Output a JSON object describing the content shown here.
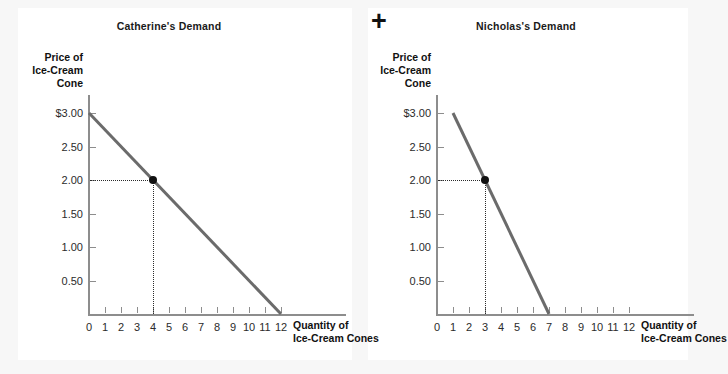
{
  "figure": {
    "operator": "+",
    "background_color": "#f7f7f7",
    "panel_color": "#ffffff",
    "curve_color": "#6b6b6b",
    "axis_color": "#8d8d8d",
    "point_color": "#111111"
  },
  "chart_data": [
    {
      "type": "line",
      "title": "Catherine's Demand",
      "xlabel": "Quantity of Ice-Cream Cones",
      "ylabel": "Price of Ice-Cream Cone",
      "xlabel_lines": [
        "Quantity of",
        "Ice-Cream Cones"
      ],
      "ylabel_lines": [
        "Price of",
        "Ice-Cream",
        "Cone"
      ],
      "xlim": [
        0,
        12
      ],
      "ylim": [
        0,
        3.0
      ],
      "grid": false,
      "legend": "none",
      "xticks": [
        0,
        1,
        2,
        3,
        4,
        5,
        6,
        7,
        8,
        9,
        10,
        11,
        12
      ],
      "xticklabels": [
        "0",
        "1",
        "2",
        "3",
        "4",
        "5",
        "6",
        "7",
        "8",
        "9",
        "10",
        "11",
        "12"
      ],
      "yticks": [
        0.5,
        1.0,
        1.5,
        2.0,
        2.5,
        3.0
      ],
      "yticklabels": [
        "0.50",
        "1.00",
        "1.50",
        "2.00",
        "2.50",
        "$3.00"
      ],
      "series": [
        {
          "name": "Catherine's demand curve",
          "x": [
            0,
            12
          ],
          "y": [
            3.0,
            0.0
          ]
        }
      ],
      "annotations": [
        {
          "type": "point",
          "x": 4,
          "y": 2.0,
          "guides": "dotted"
        }
      ]
    },
    {
      "type": "line",
      "title": "Nicholas's Demand",
      "xlabel": "Quantity of Ice-Cream Cones",
      "ylabel": "Price of Ice-Cream Cone",
      "xlabel_lines": [
        "Quantity of",
        "Ice-Cream Cones"
      ],
      "ylabel_lines": [
        "Price of",
        "Ice-Cream",
        "Cone"
      ],
      "xlim": [
        0,
        12
      ],
      "ylim": [
        0,
        3.0
      ],
      "grid": false,
      "legend": "none",
      "xticks": [
        0,
        1,
        2,
        3,
        4,
        5,
        6,
        7,
        8,
        9,
        10,
        11,
        12
      ],
      "xticklabels": [
        "0",
        "1",
        "2",
        "3",
        "4",
        "5",
        "6",
        "7",
        "8",
        "9",
        "10",
        "11",
        "12"
      ],
      "yticks": [
        0.5,
        1.0,
        1.5,
        2.0,
        2.5,
        3.0
      ],
      "yticklabels": [
        "0.50",
        "1.00",
        "1.50",
        "2.00",
        "2.50",
        "$3.00"
      ],
      "series": [
        {
          "name": "Nicholas's demand curve",
          "x": [
            1,
            7
          ],
          "y": [
            3.0,
            0.0
          ]
        }
      ],
      "annotations": [
        {
          "type": "point",
          "x": 3,
          "y": 2.0,
          "guides": "dotted"
        }
      ]
    }
  ]
}
